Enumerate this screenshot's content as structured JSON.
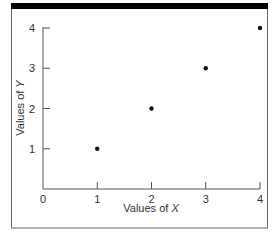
{
  "chart_data": {
    "type": "scatter",
    "title": "",
    "xlabel": "Values of X",
    "ylabel": "Values of Y",
    "xlabel_parts": {
      "prefix": "Values of ",
      "var": "X"
    },
    "ylabel_parts": {
      "prefix": "Values of ",
      "var": "Y"
    },
    "x": [
      1,
      2,
      3,
      4
    ],
    "y": [
      1,
      2,
      3,
      4
    ],
    "points": [
      {
        "x": 1,
        "y": 1
      },
      {
        "x": 2,
        "y": 2
      },
      {
        "x": 3,
        "y": 3
      },
      {
        "x": 4,
        "y": 4
      }
    ],
    "xlim": [
      0,
      4
    ],
    "ylim": [
      0,
      4
    ],
    "xticks": [
      "0",
      "1",
      "2",
      "3",
      "4"
    ],
    "yticks": [
      "1",
      "2",
      "3",
      "4"
    ],
    "grid": false,
    "legend": null,
    "colors": {
      "points": "#111111",
      "axes": "#555555",
      "frame": "#555555",
      "top_bar": "#000000"
    }
  }
}
